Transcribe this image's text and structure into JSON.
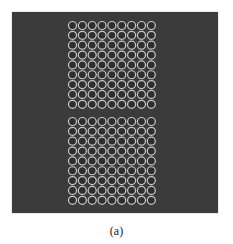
{
  "figure": {
    "caption": "(a)",
    "panel_color": "#3b3b3b",
    "ring_color": "#c9c9c9",
    "blocks": [
      {
        "name": "top-array",
        "rows": 9,
        "cols": 9,
        "x0": 72.5,
        "y0": 25.5,
        "pitch": 9.85
      },
      {
        "name": "bottom-array",
        "rows": 9,
        "cols": 9,
        "x0": 72.5,
        "y0": 121.5,
        "pitch": 9.85
      }
    ],
    "circle_radius": 4
  }
}
